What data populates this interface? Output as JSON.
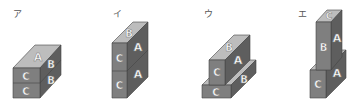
{
  "colors": {
    "top": "#bdbdbd",
    "front": "#7f7f7f",
    "side": "#5e5e5e",
    "edge": "#444444",
    "background": "#ffffff"
  },
  "figures": [
    {
      "id": "a",
      "label": "ア",
      "faces": {
        "top": [
          "A"
        ],
        "front": [
          "C",
          "C"
        ],
        "right": [
          "B",
          "B"
        ]
      }
    },
    {
      "id": "i",
      "label": "イ",
      "faces": {
        "top": [
          "B"
        ],
        "front": [
          "C",
          "C"
        ],
        "right": [
          "A",
          "A"
        ]
      }
    },
    {
      "id": "u",
      "label": "ウ",
      "faces": {
        "upper_top": [
          "B"
        ],
        "upper_front": [
          "C"
        ],
        "upper_right": [
          "A"
        ],
        "lower_front": [
          "C"
        ],
        "lower_right": [
          "B"
        ]
      }
    },
    {
      "id": "e",
      "label": "エ",
      "faces": {
        "upper_top": [
          "C"
        ],
        "upper_front": [
          "B"
        ],
        "upper_right": [
          "A"
        ],
        "lower_front": [
          "C"
        ],
        "lower_right": [
          "A"
        ]
      }
    }
  ]
}
